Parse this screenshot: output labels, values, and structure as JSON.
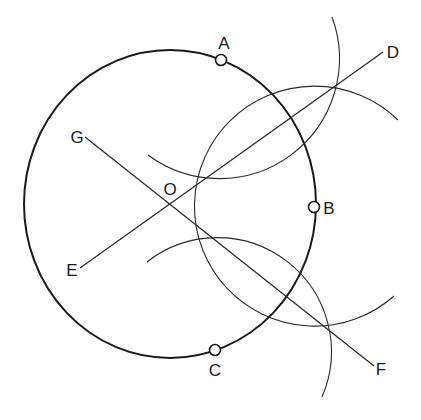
{
  "figure": {
    "colors": {
      "stroke": "#1a1a1a",
      "background": "#ffffff"
    },
    "labels": {
      "A": "A",
      "B": "B",
      "C": "C",
      "D": "D",
      "E": "E",
      "F": "F",
      "G": "G",
      "O": "O"
    },
    "points_on_circle": [
      "A",
      "B",
      "C"
    ],
    "lines": [
      {
        "from": "E",
        "to": "D",
        "through": "O"
      },
      {
        "from": "G",
        "to": "F",
        "through": "O"
      }
    ],
    "arcs": [
      {
        "center": "A"
      },
      {
        "center": "B"
      },
      {
        "center": "C"
      }
    ]
  }
}
